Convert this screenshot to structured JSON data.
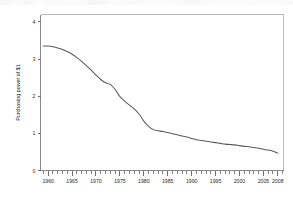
{
  "figure": {
    "background_color": "#ffffff",
    "line_color": "#5a5a5a",
    "axis_color": "#8a8a8a",
    "frame_color": "#b9b9b9",
    "text_color": "#2b2b2b"
  },
  "chart_data": {
    "type": "line",
    "title": "",
    "subtitle": "",
    "xlabel": "",
    "ylabel": "Purchasing power of $1",
    "xlim": [
      1958.4,
      2009.2
    ],
    "ylim": [
      0,
      4.2
    ],
    "grid": false,
    "legend": null,
    "legend_position": "none",
    "x_tick_labels": [
      "1960",
      "1965",
      "1970",
      "1975",
      "1980",
      "1985",
      "1990",
      "1995",
      "2000",
      "2005",
      "2008"
    ],
    "x_tick_values": [
      1960,
      1965,
      1970,
      1975,
      1980,
      1985,
      1990,
      1995,
      2000,
      2005,
      2008
    ],
    "x_minor_tick_step": 1,
    "y_tick_labels": [
      "0",
      "1",
      "2",
      "3",
      "4"
    ],
    "y_tick_values": [
      0,
      1,
      2,
      3,
      4
    ],
    "series": [
      {
        "name": "Purchasing power of $1",
        "color": "#5a5a5a",
        "x": [
          1959,
          1960,
          1961,
          1962,
          1963,
          1964,
          1965,
          1966,
          1967,
          1968,
          1969,
          1970,
          1971,
          1972,
          1973,
          1974,
          1975,
          1976,
          1977,
          1978,
          1979,
          1980,
          1981,
          1982,
          1983,
          1984,
          1985,
          1986,
          1987,
          1988,
          1989,
          1990,
          1991,
          1992,
          1993,
          1994,
          1995,
          1996,
          1997,
          1998,
          1999,
          2000,
          2001,
          2002,
          2003,
          2004,
          2005,
          2006,
          2007,
          2008
        ],
        "values": [
          3.35,
          3.35,
          3.33,
          3.3,
          3.26,
          3.2,
          3.13,
          3.04,
          2.94,
          2.82,
          2.7,
          2.57,
          2.45,
          2.36,
          2.32,
          2.18,
          1.99,
          1.87,
          1.76,
          1.66,
          1.52,
          1.33,
          1.19,
          1.1,
          1.07,
          1.05,
          1.02,
          0.99,
          0.96,
          0.93,
          0.9,
          0.86,
          0.83,
          0.81,
          0.79,
          0.77,
          0.75,
          0.73,
          0.71,
          0.7,
          0.69,
          0.67,
          0.65,
          0.64,
          0.62,
          0.6,
          0.57,
          0.55,
          0.52,
          0.47
        ]
      }
    ]
  }
}
